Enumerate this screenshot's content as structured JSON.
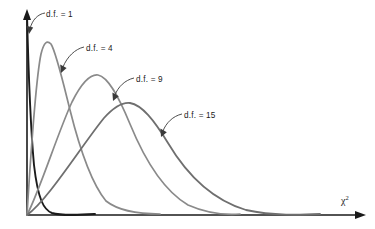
{
  "figure": {
    "title": "",
    "axis_x_label": "χ",
    "axis_x_label_sup": "2",
    "background_color": "#ffffff",
    "axis_color": "#1a1a1a"
  },
  "annotations": [
    {
      "id": "df1",
      "label": "d.f. = 1",
      "x": 46,
      "y": 11,
      "arrow_tip_x": 29,
      "arrow_tip_y": 32
    },
    {
      "id": "df4",
      "label": "d.f. = 4",
      "x": 86,
      "y": 45,
      "arrow_tip_x": 62,
      "arrow_tip_y": 71
    },
    {
      "id": "df9",
      "label": "d.f. = 9",
      "x": 136,
      "y": 76,
      "arrow_tip_x": 114,
      "arrow_tip_y": 99
    },
    {
      "id": "df15",
      "label": "d.f. = 15",
      "x": 184,
      "y": 112,
      "arrow_tip_x": 162,
      "arrow_tip_y": 134
    }
  ],
  "chart_data": {
    "type": "line",
    "xlabel": "χ²",
    "ylabel": "",
    "grid": false,
    "legend": "inline-annotations",
    "xlim": [
      0,
      40
    ],
    "ylim": [
      0,
      1
    ],
    "series": [
      {
        "name": "d.f. = 1",
        "degrees_of_freedom": 1,
        "color": "#1b1b1b",
        "stroke_width": 1.9,
        "mode": 0,
        "peak_pixel": [
          27,
          13
        ],
        "tail_end_x_pixel": 95,
        "description": "Monotone decreasing, asymptotic to the y-axis near zero and to the x-axis for large values.",
        "path": "M 27,14 C 28.4,70 30.6,128 34,165 C 38,200 44,210 52,213 C 62,216 78,215 95,214"
      },
      {
        "name": "d.f. = 4",
        "degrees_of_freedom": 4,
        "color": "#8a8a8a",
        "stroke_width": 1.7,
        "mode": 2,
        "peak_pixel": [
          47,
          41
        ],
        "tail_end_x_pixel": 160,
        "description": "Right-skewed unimodal curve peaking early.",
        "path": "M 27,215 C 31,150 36,78 41,54 C 44,42 47,40 51,44 C 56,52 62,78 70,110 C 80,150 92,184 106,201 C 120,212 142,214 160,214"
      },
      {
        "name": "d.f. = 9",
        "degrees_of_freedom": 9,
        "color": "#8a8a8a",
        "stroke_width": 1.7,
        "mode": 7,
        "peak_pixel": [
          95,
          74
        ],
        "tail_end_x_pixel": 240,
        "description": "Right-skewed unimodal curve, flatter and shifted right relative to d.f. = 4.",
        "path": "M 27,215 C 40,190 58,132 72,102 C 82,82 90,74 98,75 C 108,77 118,95 130,124 C 146,163 166,192 188,205 C 206,213 226,215 240,214"
      },
      {
        "name": "d.f. = 15",
        "degrees_of_freedom": 15,
        "color": "#6f6f6f",
        "stroke_width": 1.8,
        "mode": 13,
        "peak_pixel": [
          127,
          103
        ],
        "tail_end_x_pixel": 320,
        "description": "Broadest, most symmetric curve, shifted furthest right.",
        "path": "M 27,215 C 48,200 82,145 104,118 C 114,107 122,102 130,103 C 142,105 154,120 168,143 C 190,180 216,201 246,210 C 274,216 300,215 320,214"
      }
    ]
  }
}
